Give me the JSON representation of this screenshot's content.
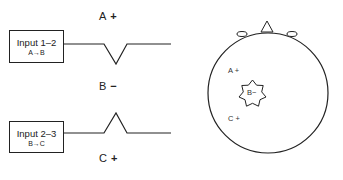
{
  "left_panel": {
    "electrodes": [
      {
        "label": "A",
        "sign": "+"
      },
      {
        "label": "B",
        "sign": "−"
      },
      {
        "label": "C",
        "sign": "+"
      }
    ],
    "channels": [
      {
        "title": "Input 1–2",
        "subtitle": "A→B",
        "deflection": "downward"
      },
      {
        "title": "Input 2–3",
        "subtitle": "B→C",
        "deflection": "upward"
      }
    ]
  },
  "head_map": {
    "labels": [
      {
        "text": "A +"
      },
      {
        "text": "B−"
      },
      {
        "text": "C +"
      }
    ],
    "icons": [
      "head-outline-icon",
      "nose-icon",
      "ear-icon",
      "star-source-icon"
    ]
  }
}
